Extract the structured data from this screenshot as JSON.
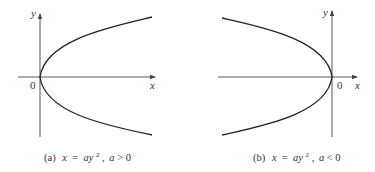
{
  "panels": [
    {
      "id": "a",
      "caption_prefix": "(a)",
      "equation_lhs": "x",
      "equation_eq": " = ",
      "equation_rhs_base": "ay",
      "equation_exp": "2",
      "condition_var": "a",
      "condition_op": " > ",
      "condition_val": "0",
      "origin_label": "0",
      "x_axis_label": "x",
      "y_axis_label": "y",
      "opens": "right"
    },
    {
      "id": "b",
      "caption_prefix": "(b)",
      "equation_lhs": "x",
      "equation_eq": " = ",
      "equation_rhs_base": "ay",
      "equation_exp": "2",
      "condition_var": "a",
      "condition_op": " < ",
      "condition_val": "0",
      "origin_label": "0",
      "x_axis_label": "x",
      "y_axis_label": "y",
      "opens": "left"
    }
  ],
  "colors": {
    "curve": "#222222",
    "axis": "#444444",
    "text": "#333333",
    "background": "#ffffff"
  }
}
